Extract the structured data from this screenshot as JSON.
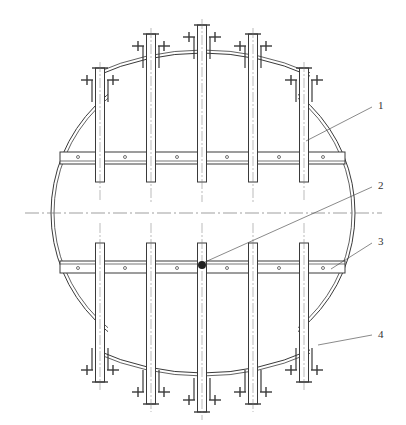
{
  "drawing": {
    "title": "",
    "stroke_color": "#3a3a3a",
    "center_line_color": "#777777",
    "background": "#ffffff"
  },
  "shell": {
    "cx": 203,
    "cy": 213,
    "r": 152
  },
  "center_line": {
    "y": 213,
    "x1": 25,
    "x2": 382
  },
  "pipes": [
    {
      "x": 100,
      "top": 68,
      "bottom": 390
    },
    {
      "x": 151,
      "top": 34,
      "bottom": 412
    },
    {
      "x": 202,
      "top": 25,
      "bottom": 420
    },
    {
      "x": 253,
      "top": 34,
      "bottom": 412
    },
    {
      "x": 304,
      "top": 68,
      "bottom": 390
    }
  ],
  "upper_manifold": {
    "y_top": 152,
    "y_bot": 164,
    "x1": 60,
    "x2": 345,
    "pipe_end": 182
  },
  "lower_manifold": {
    "y_top": 261,
    "y_bot": 273,
    "x1": 60,
    "x2": 345,
    "pipe_start": 243
  },
  "callouts": [
    {
      "id": "1",
      "text": "1",
      "label_x": 378,
      "label_y": 109,
      "from_x": 306,
      "from_y": 141,
      "to_x": 372,
      "to_y": 107
    },
    {
      "id": "2",
      "text": "2",
      "label_x": 378,
      "label_y": 189,
      "from_x": 205,
      "from_y": 262,
      "to_x": 372,
      "to_y": 187
    },
    {
      "id": "3",
      "text": "3",
      "label_x": 378,
      "label_y": 245,
      "from_x": 331,
      "from_y": 269,
      "to_x": 372,
      "to_y": 243
    },
    {
      "id": "4",
      "text": "4",
      "label_x": 378,
      "label_y": 338,
      "from_x": 318,
      "from_y": 345,
      "to_x": 372,
      "to_y": 335
    }
  ]
}
